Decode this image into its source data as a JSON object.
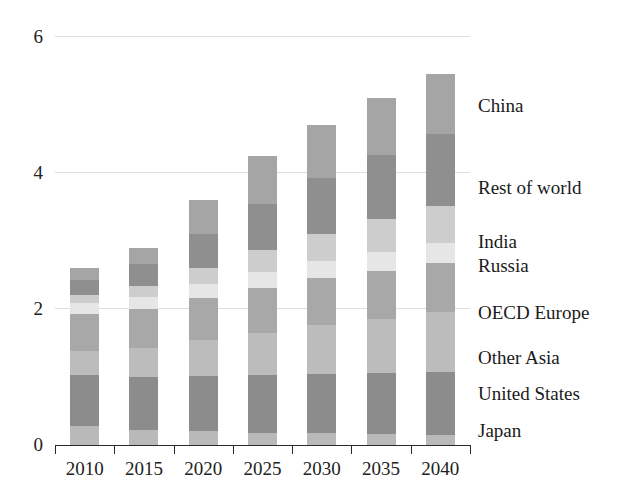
{
  "chart_data": {
    "type": "bar",
    "stacked": true,
    "title": "",
    "xlabel": "",
    "ylabel": "",
    "categories": [
      "2010",
      "2015",
      "2020",
      "2025",
      "2030",
      "2035",
      "2040"
    ],
    "ylim": [
      0,
      6
    ],
    "yticks": [
      0,
      2,
      4,
      6
    ],
    "ytick_labels": [
      "0",
      "2",
      "4",
      "6"
    ],
    "grid": true,
    "legend_position": "right-inline",
    "series": [
      {
        "name": "Japan",
        "color": "#b9b9b9",
        "values": [
          0.28,
          0.22,
          0.2,
          0.18,
          0.17,
          0.16,
          0.15
        ]
      },
      {
        "name": "United States",
        "color": "#8c8c8c",
        "values": [
          0.75,
          0.78,
          0.82,
          0.85,
          0.88,
          0.9,
          0.92
        ]
      },
      {
        "name": "Other Asia",
        "color": "#bcbcbc",
        "values": [
          0.35,
          0.42,
          0.52,
          0.62,
          0.72,
          0.8,
          0.88
        ]
      },
      {
        "name": "OECD Europe",
        "color": "#a8a8a8",
        "values": [
          0.55,
          0.58,
          0.62,
          0.66,
          0.68,
          0.7,
          0.72
        ]
      },
      {
        "name": "Russia",
        "color": "#e6e6e6",
        "values": [
          0.16,
          0.18,
          0.21,
          0.24,
          0.26,
          0.28,
          0.3
        ]
      },
      {
        "name": "India",
        "color": "#cdcdcd",
        "values": [
          0.12,
          0.16,
          0.24,
          0.32,
          0.4,
          0.48,
          0.55
        ]
      },
      {
        "name": "Rest of world",
        "color": "#8f8f8f",
        "values": [
          0.22,
          0.32,
          0.5,
          0.68,
          0.82,
          0.95,
          1.05
        ]
      },
      {
        "name": "China",
        "color": "#a5a5a5",
        "values": [
          0.17,
          0.24,
          0.49,
          0.7,
          0.77,
          0.83,
          0.88
        ]
      }
    ],
    "totals": [
      2.6,
      2.9,
      3.6,
      4.25,
      4.7,
      5.1,
      5.45
    ]
  },
  "legend": {
    "entries": [
      {
        "label": "China",
        "y_value": 5.0
      },
      {
        "label": "Rest of world",
        "y_value": 3.8
      },
      {
        "label": "India",
        "y_value": 3.0
      },
      {
        "label": "Russia",
        "y_value": 2.65
      },
      {
        "label": "OECD Europe",
        "y_value": 1.95
      },
      {
        "label": "Other Asia",
        "y_value": 1.3
      },
      {
        "label": "United States",
        "y_value": 0.77
      },
      {
        "label": "Japan",
        "y_value": 0.22
      }
    ]
  },
  "colors": {
    "axis": "#2a2a2a",
    "grid": "#dedede",
    "text": "#1a1a1a",
    "background": "#ffffff"
  }
}
